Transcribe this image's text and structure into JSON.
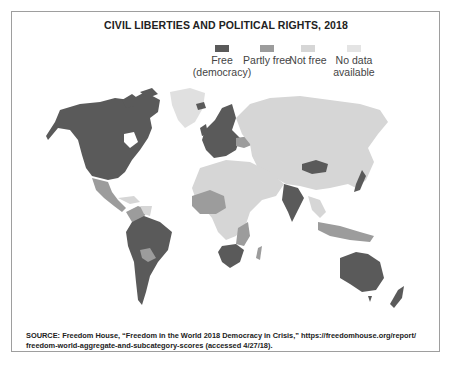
{
  "title": "CIVIL LIBERTIES AND POLITICAL RIGHTS, 2018",
  "legend": {
    "items": [
      {
        "label_line1": "Free",
        "label_line2": "(democracy)",
        "color": "#5a5a5a"
      },
      {
        "label_line1": "Partly free",
        "label_line2": "",
        "color": "#9c9c9c"
      },
      {
        "label_line1": "Not free",
        "label_line2": "",
        "color": "#d6d6d6"
      },
      {
        "label_line1": "No data",
        "label_line2": "available",
        "color": "#e4e4e4"
      }
    ]
  },
  "map": {
    "type": "world choropleth",
    "regions": {
      "free": [
        "United States",
        "Canada",
        "Brazil",
        "Argentina",
        "Chile",
        "Western Europe",
        "Scandinavia",
        "India",
        "Mongolia",
        "Japan",
        "Australia",
        "New Zealand",
        "South Africa",
        "Botswana",
        "Namibia"
      ],
      "partly_free": [
        "Mexico",
        "Colombia",
        "Bolivia",
        "Central America",
        "West Africa",
        "Ukraine",
        "Southeast Asia",
        "Indonesia",
        "Papua New Guinea",
        "Madagascar",
        "Mozambique",
        "Tanzania"
      ],
      "not_free": [
        "Russia",
        "China",
        "Middle East",
        "North Africa",
        "Central Africa",
        "Venezuela",
        "Cuba",
        "Central Asia"
      ],
      "no_data": [
        "Greenland"
      ]
    }
  },
  "source": {
    "line1": "SOURCE: Freedom House, “Freedom in the World 2018 Democracy in Crisis,” https://freedomhouse.org/report/",
    "line2": "freedom-world-aggregate-and-subcategory-scores (accessed 4/27/18)."
  }
}
